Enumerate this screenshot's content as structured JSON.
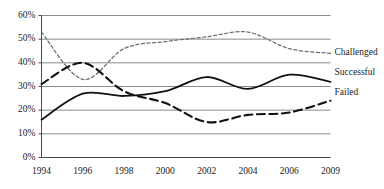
{
  "chart_data": {
    "type": "line",
    "title": "",
    "subtitle": "",
    "xlabel": "",
    "ylabel": "",
    "x": [
      "1994",
      "1996",
      "1998",
      "2000",
      "2002",
      "2004",
      "2006",
      "2009"
    ],
    "categories": [
      "1994",
      "1996",
      "1998",
      "2000",
      "2002",
      "2004",
      "2006",
      "2009"
    ],
    "xtick_labels": [
      "1994",
      "1996",
      "1998",
      "2000",
      "2002",
      "2004",
      "2006",
      "2009"
    ],
    "ytick_labels": [
      "0%",
      "10%",
      "20%",
      "30%",
      "40%",
      "50%",
      "60%"
    ],
    "ytick_values": [
      0,
      10,
      20,
      30,
      40,
      50,
      60
    ],
    "ylim": [
      0,
      60
    ],
    "grid": "horizontal",
    "legend_position": "right-inline",
    "series": [
      {
        "name": "Challenged",
        "label": "Challenged",
        "values": [
          53,
          33,
          46,
          49,
          51,
          53,
          46,
          44
        ],
        "style": "dotted",
        "color": "#6f6f6f"
      },
      {
        "name": "Successful",
        "label": "Successful",
        "values": [
          16,
          27,
          26,
          28,
          34,
          29,
          35,
          32
        ],
        "style": "solid",
        "color": "#111111"
      },
      {
        "name": "Failed",
        "label": "Failed",
        "values": [
          31,
          40,
          28,
          23,
          15,
          18,
          19,
          24
        ],
        "style": "dashed",
        "color": "#111111"
      }
    ],
    "annotations": [
      {
        "text": "Challenged",
        "series": "Challenged"
      },
      {
        "text": "Successful",
        "series": "Successful"
      },
      {
        "text": "Failed",
        "series": "Failed"
      }
    ]
  },
  "axis": {
    "y": {
      "ticks": [
        {
          "label": "60%"
        },
        {
          "label": "50%"
        },
        {
          "label": "40%"
        },
        {
          "label": "30%"
        },
        {
          "label": "20%"
        },
        {
          "label": "10%"
        },
        {
          "label": "0%"
        }
      ]
    },
    "x": {
      "ticks": [
        {
          "label": "1994"
        },
        {
          "label": "1996"
        },
        {
          "label": "1998"
        },
        {
          "label": "2000"
        },
        {
          "label": "2002"
        },
        {
          "label": "2004"
        },
        {
          "label": "2006"
        },
        {
          "label": "2009"
        }
      ]
    }
  },
  "legend": {
    "items": [
      {
        "label": "Challenged"
      },
      {
        "label": "Successful"
      },
      {
        "label": "Failed"
      }
    ]
  },
  "colors": {
    "grid": "#8a8a8a",
    "axis": "#4a4a4a",
    "challenged": "#6f6f6f",
    "successful": "#111111",
    "failed": "#111111",
    "background": "#ffffff"
  }
}
